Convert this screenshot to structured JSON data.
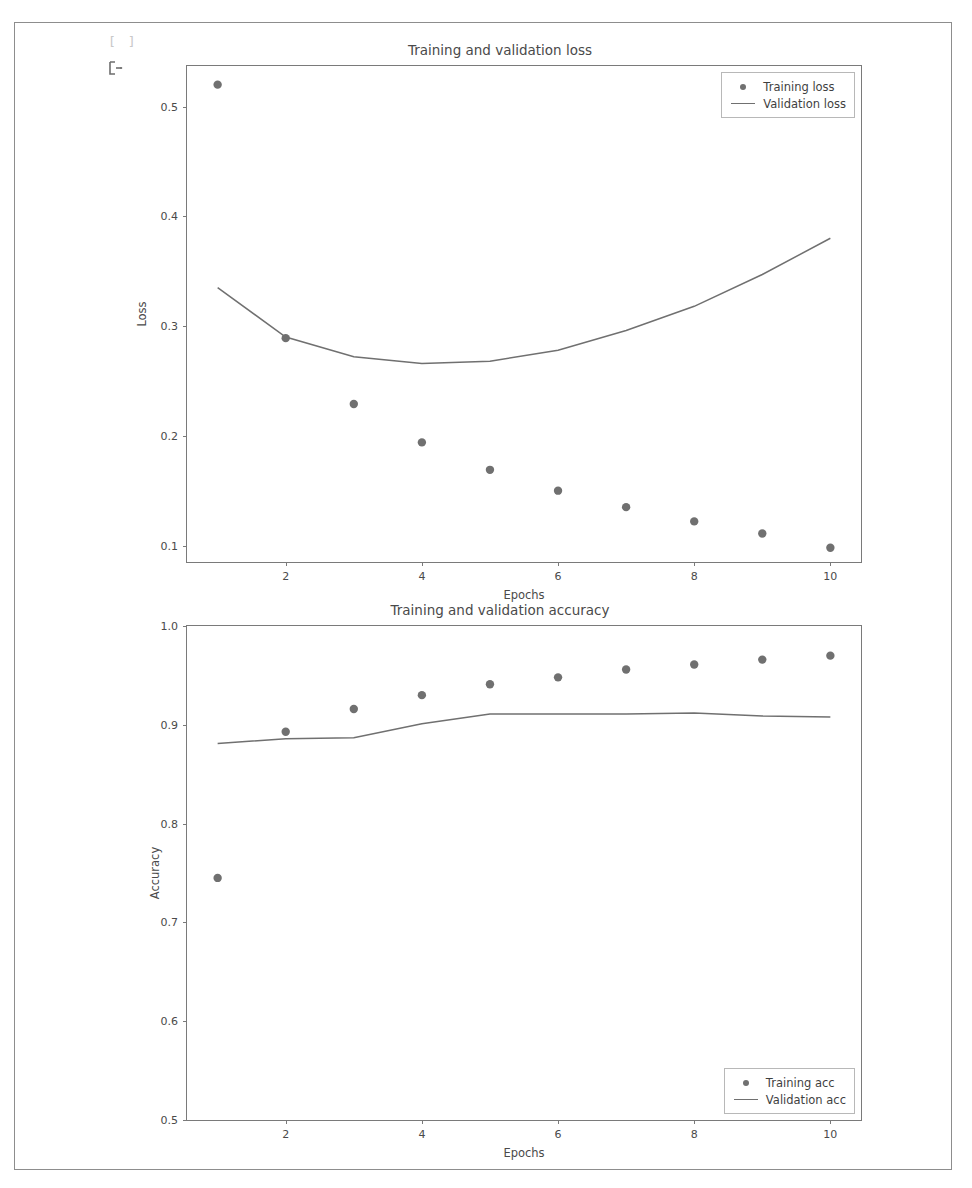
{
  "notebook": {
    "cell_prompt": "[ ]",
    "output_marker_name": "cell-output-arrow-icon"
  },
  "colors": {
    "marker": "#707070",
    "line": "#707070",
    "axis": "#7a7a7a",
    "text": "#4a4a4a",
    "frame": "#8d8d8d",
    "background": "#ffffff"
  },
  "chart_data": [
    {
      "type": "scatter",
      "title": "Training and validation loss",
      "xlabel": "Epochs",
      "ylabel": "Loss",
      "x": [
        1,
        2,
        3,
        4,
        5,
        6,
        7,
        8,
        9,
        10
      ],
      "xlim": [
        0.55,
        10.45
      ],
      "ylim": [
        0.085,
        0.537
      ],
      "xticks": [
        2,
        4,
        6,
        8,
        10
      ],
      "xticklabels": [
        "2",
        "4",
        "6",
        "8",
        "10"
      ],
      "yticks": [
        0.1,
        0.2,
        0.3,
        0.4,
        0.5
      ],
      "yticklabels": [
        "0.1",
        "0.2",
        "0.3",
        "0.4",
        "0.5"
      ],
      "grid": false,
      "legend_position": "upper right",
      "series": [
        {
          "name": "Training loss",
          "style": "markers",
          "marker": "circle",
          "values": [
            0.52,
            0.289,
            0.229,
            0.194,
            0.169,
            0.15,
            0.135,
            0.122,
            0.111,
            0.098
          ]
        },
        {
          "name": "Validation loss",
          "style": "line",
          "values": [
            0.335,
            0.29,
            0.272,
            0.266,
            0.268,
            0.278,
            0.296,
            0.318,
            0.347,
            0.38
          ]
        }
      ]
    },
    {
      "type": "scatter",
      "title": "Training and validation accuracy",
      "xlabel": "Epochs",
      "ylabel": "Accuracy",
      "x": [
        1,
        2,
        3,
        4,
        5,
        6,
        7,
        8,
        9,
        10
      ],
      "xlim": [
        0.55,
        10.45
      ],
      "ylim": [
        0.5,
        1.0
      ],
      "xticks": [
        2,
        4,
        6,
        8,
        10
      ],
      "xticklabels": [
        "2",
        "4",
        "6",
        "8",
        "10"
      ],
      "yticks": [
        0.5,
        0.6,
        0.7,
        0.8,
        0.9,
        1.0
      ],
      "yticklabels": [
        "0.5",
        "0.6",
        "0.7",
        "0.8",
        "0.9",
        "1.0"
      ],
      "grid": false,
      "legend_position": "lower right",
      "series": [
        {
          "name": "Training acc",
          "style": "markers",
          "marker": "circle",
          "values": [
            0.745,
            0.893,
            0.916,
            0.93,
            0.941,
            0.948,
            0.956,
            0.961,
            0.966,
            0.97
          ]
        },
        {
          "name": "Validation acc",
          "style": "line",
          "values": [
            0.881,
            0.886,
            0.887,
            0.901,
            0.911,
            0.911,
            0.911,
            0.912,
            0.909,
            0.908
          ]
        }
      ]
    }
  ]
}
